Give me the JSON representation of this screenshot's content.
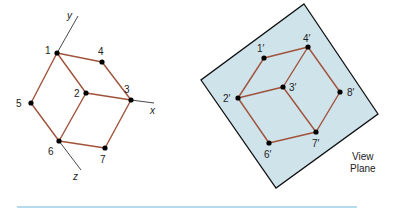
{
  "colors": {
    "edge": "#a0523a",
    "axis": "#333333",
    "vertex": "#000000",
    "plane_fill": "#cfe3ea",
    "plane_stroke": "#111111",
    "rule": "#9ccfe6"
  },
  "left_figure": {
    "axes": [
      {
        "name": "y",
        "from": [
          57,
          53
        ],
        "to": [
          78,
          16
        ],
        "label_pos": [
          67,
          19
        ]
      },
      {
        "name": "x",
        "from": [
          131,
          100
        ],
        "to": [
          154,
          103
        ],
        "label_pos": [
          150,
          114
        ]
      },
      {
        "name": "z",
        "from": [
          59,
          141
        ],
        "to": [
          81,
          170
        ],
        "label_pos": [
          73,
          180
        ]
      }
    ],
    "vertices": [
      {
        "label": "1",
        "pos": [
          57,
          53
        ],
        "label_pos": [
          45,
          54
        ]
      },
      {
        "label": "2",
        "pos": [
          86,
          93
        ],
        "label_pos": [
          74,
          97
        ]
      },
      {
        "label": "3",
        "pos": [
          131,
          100
        ],
        "label_pos": [
          124,
          93
        ]
      },
      {
        "label": "4",
        "pos": [
          102,
          62
        ],
        "label_pos": [
          98,
          55
        ]
      },
      {
        "label": "5",
        "pos": [
          31,
          103
        ],
        "label_pos": [
          16,
          107
        ]
      },
      {
        "label": "6",
        "pos": [
          59,
          141
        ],
        "label_pos": [
          48,
          155
        ]
      },
      {
        "label": "7",
        "pos": [
          105,
          148
        ],
        "label_pos": [
          100,
          163
        ]
      }
    ],
    "edges": [
      [
        "1",
        "4"
      ],
      [
        "4",
        "3"
      ],
      [
        "1",
        "2"
      ],
      [
        "2",
        "3"
      ],
      [
        "1",
        "5"
      ],
      [
        "5",
        "6"
      ],
      [
        "2",
        "6"
      ],
      [
        "6",
        "7"
      ],
      [
        "7",
        "3"
      ]
    ]
  },
  "right_figure": {
    "plane_corners": [
      [
        304,
        4
      ],
      [
        378,
        114
      ],
      [
        276,
        188
      ],
      [
        201,
        80
      ]
    ],
    "plane_label_lines": [
      "View",
      "Plane"
    ],
    "vertices": [
      {
        "label": "1′",
        "pos": [
          264,
          58
        ],
        "label_pos": [
          257,
          52
        ]
      },
      {
        "label": "2′",
        "pos": [
          238,
          98
        ],
        "label_pos": [
          223,
          102
        ]
      },
      {
        "label": "3′",
        "pos": [
          283,
          87
        ],
        "label_pos": [
          289,
          91
        ]
      },
      {
        "label": "4′",
        "pos": [
          308,
          47
        ],
        "label_pos": [
          303,
          42
        ]
      },
      {
        "label": "6′",
        "pos": [
          269,
          143
        ],
        "label_pos": [
          264,
          158
        ]
      },
      {
        "label": "7′",
        "pos": [
          316,
          132
        ],
        "label_pos": [
          312,
          147
        ]
      },
      {
        "label": "8′",
        "pos": [
          340,
          92
        ],
        "label_pos": [
          347,
          96
        ]
      }
    ],
    "edges": [
      [
        "1′",
        "4′"
      ],
      [
        "1′",
        "2′"
      ],
      [
        "2′",
        "3′"
      ],
      [
        "3′",
        "4′"
      ],
      [
        "4′",
        "8′"
      ],
      [
        "3′",
        "7′"
      ],
      [
        "8′",
        "7′"
      ],
      [
        "2′",
        "6′"
      ],
      [
        "6′",
        "7′"
      ]
    ]
  },
  "rule": {
    "from": [
      17,
      207
    ],
    "to": [
      357,
      207
    ]
  }
}
